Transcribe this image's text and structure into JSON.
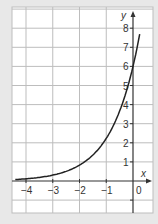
{
  "chart_data": {
    "type": "line",
    "title": "",
    "xlabel": "x",
    "ylabel": "y",
    "xlim": [
      -4.5,
      0.75
    ],
    "ylim": [
      -1.65,
      9.25
    ],
    "grid": true,
    "x_ticks": [
      -4,
      -3,
      -2,
      -1,
      0
    ],
    "x_tick_labels": [
      "-4",
      "-3",
      "-2",
      "-1",
      "0"
    ],
    "y_ticks": [
      1,
      2,
      3,
      4,
      5,
      6,
      7,
      8
    ],
    "y_tick_labels": [
      "1",
      "2",
      "3",
      "4",
      "5",
      "6",
      "7",
      "8"
    ],
    "series": [
      {
        "name": "curve",
        "x": [
          -4.4,
          -4,
          -3.5,
          -3,
          -2.5,
          -2,
          -1.5,
          -1,
          -0.5,
          0,
          0.25
        ],
        "y": [
          0.07,
          0.11,
          0.18,
          0.3,
          0.49,
          0.81,
          1.34,
          2.2,
          3.64,
          6.0,
          8.6
        ]
      }
    ],
    "colors": {
      "curve": "#222222",
      "grid": "#bdbdbd",
      "axis": "#333333",
      "panel": "#ffffff",
      "background": "#e8e8e8"
    }
  }
}
